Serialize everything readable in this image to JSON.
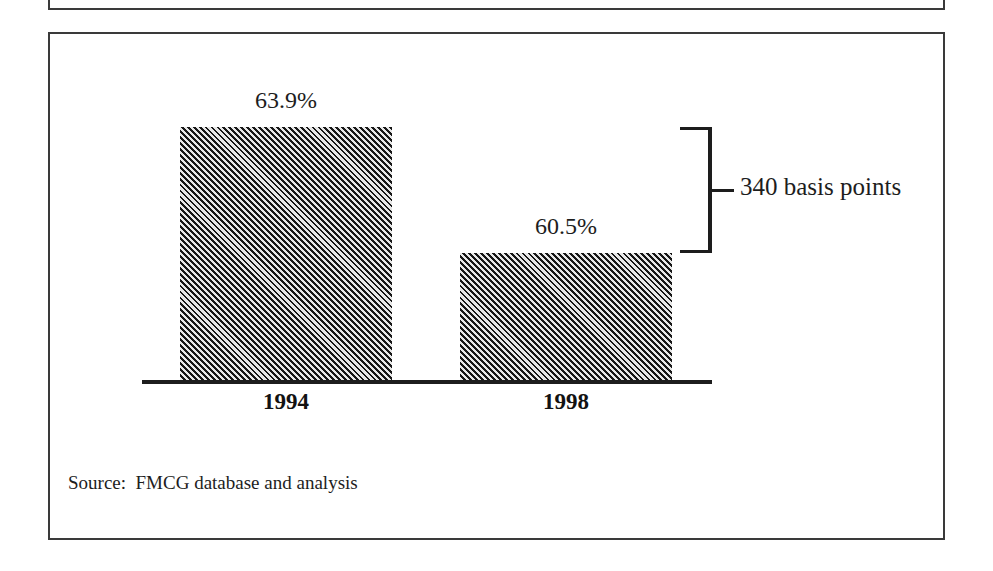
{
  "exhibit": {
    "source_note": "Source:  FMCG database and analysis",
    "border_color": "#3a3a3a",
    "background_color": "#ffffff"
  },
  "chart_data": {
    "type": "bar",
    "title": "",
    "subtitle": "",
    "xlabel": "",
    "ylabel": "",
    "categories": [
      "1994",
      "1998"
    ],
    "values": [
      63.9,
      60.5
    ],
    "value_labels": [
      "63.9%",
      "60.5%"
    ],
    "unit": "%",
    "ylim": [
      0,
      63.9
    ],
    "grid": false,
    "legend": null,
    "series": [
      {
        "name": "",
        "values": [
          63.9,
          60.5
        ]
      }
    ],
    "annotations": [
      {
        "type": "bracket-delta",
        "label": "340 basis points",
        "from_category": "1994",
        "to_category": "1998",
        "value": 3.4,
        "unit": "basis points",
        "value_in_bps": 340
      }
    ],
    "bar_fill": "diagonal-hatch",
    "bar_color": "#4b4b4b",
    "hatch_color": "#171717",
    "axis_color": "#1d1d1d"
  }
}
